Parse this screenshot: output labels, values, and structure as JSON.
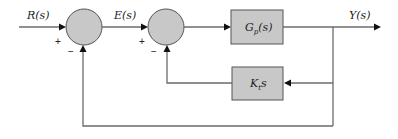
{
  "diagram": {
    "type": "feedback-control-block-diagram",
    "signals": {
      "input": "R(s)",
      "error": "E(s)",
      "output": "Y(s)"
    },
    "blocks": {
      "plant": {
        "label_main": "G",
        "label_sub": "p",
        "label_tail": "(s)"
      },
      "feedback": {
        "label_main": "K",
        "label_sub": "t",
        "label_tail": "s"
      }
    },
    "junctions": {
      "sum1": {
        "plus": "+",
        "minus": "−"
      },
      "sum2": {
        "plus": "+",
        "minus": "−"
      }
    },
    "colors": {
      "fill": "#c8c8c8",
      "stroke": "#555555",
      "wire": "#6b6b6b"
    }
  }
}
